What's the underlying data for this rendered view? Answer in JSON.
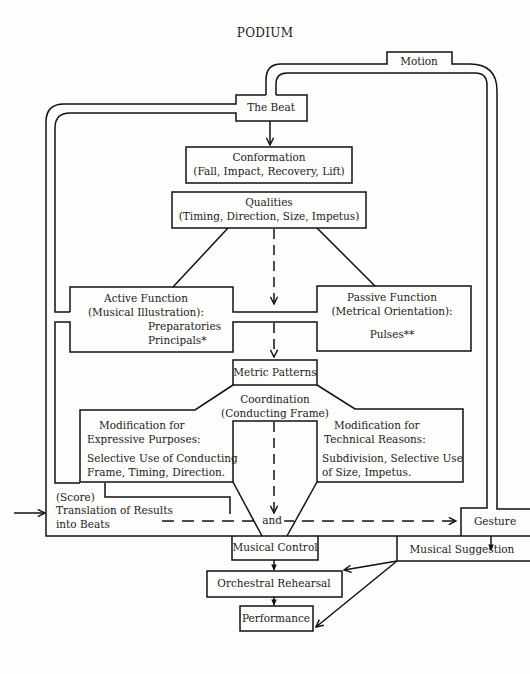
{
  "diagram": {
    "title": "PODIUM",
    "colors": {
      "line": "#111111",
      "background": "#fdfdfb",
      "text": "#222222"
    },
    "nodes": {
      "motion": {
        "label": "Motion"
      },
      "the_beat": {
        "label": "The Beat"
      },
      "conformation": {
        "title": "Conformation",
        "subtitle": "(Fall, Impact, Recovery, Lift)"
      },
      "qualities": {
        "title": "Qualities",
        "subtitle": "(Timing, Direction, Size, Impetus)"
      },
      "active_function": {
        "title": "Active Function",
        "subtitle": "(Musical Illustration):",
        "items": [
          "Preparatories",
          "Principals*"
        ]
      },
      "passive_function": {
        "title": "Passive Function",
        "subtitle": "(Metrical Orientation):",
        "items": [
          "Pulses**"
        ]
      },
      "metric_patterns": {
        "label": "Metric Patterns"
      },
      "coordination": {
        "title": "Coordination",
        "subtitle": "(Conducting Frame)"
      },
      "mod_expressive": {
        "title": "Modification for",
        "subtitle": "Expressive Purposes:",
        "line1": "Selective Use  of Conducting",
        "line2": "Frame, Timing,  Direction."
      },
      "mod_technical": {
        "title": "Modification for",
        "subtitle": "Technical Reasons:",
        "line1": "Subdivision,  Selective Use",
        "line2": "of Size,   Impetus."
      },
      "score": {
        "line1": "(Score)",
        "line2": "Translation of Results",
        "line3": "into Beats"
      },
      "and_label": "and",
      "gesture": {
        "label": "Gesture"
      },
      "musical_control": {
        "label": "Musical Control"
      },
      "musical_suggestion": {
        "label": "Musical Suggestion"
      },
      "orchestral_rehearsal": {
        "label": "Orchestral Rehearsal"
      },
      "performance": {
        "label": "Performance"
      }
    },
    "edges": [
      {
        "from": "the_beat",
        "to": "conformation",
        "style": "solid-arrow"
      },
      {
        "from": "qualities",
        "to": "active_function",
        "style": "solid-line"
      },
      {
        "from": "qualities",
        "to": "passive_function",
        "style": "solid-line"
      },
      {
        "from": "qualities",
        "to": "metric_patterns",
        "style": "dashed-arrow"
      },
      {
        "from": "metric_patterns",
        "to": "musical_control",
        "style": "dashed-arrow"
      },
      {
        "from": "score",
        "to": "gesture",
        "style": "dashed-arrow"
      },
      {
        "from": "gesture",
        "to": "musical_suggestion",
        "style": "solid-arrow"
      },
      {
        "from": "musical_control",
        "to": "orchestral_rehearsal",
        "style": "solid-arrow"
      },
      {
        "from": "orchestral_rehearsal",
        "to": "performance",
        "style": "solid-arrow"
      },
      {
        "from": "musical_suggestion",
        "to": "orchestral_rehearsal",
        "style": "solid-arrow"
      },
      {
        "from": "musical_suggestion",
        "to": "performance",
        "style": "solid-arrow"
      },
      {
        "from": "external",
        "to": "score",
        "style": "solid-arrow"
      },
      {
        "from": "motion",
        "to": "the_beat",
        "style": "double-channel"
      }
    ]
  }
}
